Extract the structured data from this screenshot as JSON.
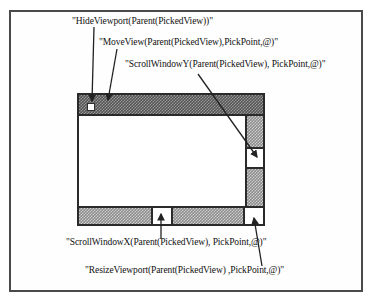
{
  "diagram": {
    "labels": {
      "hide_viewport": "\"HideViewport(Parent(PickedView))\"",
      "move_view": "\"MoveView(Parent(PickedView),PickPoint,@)\"",
      "scroll_window_y": "\"ScrollWindowY(Parent(PickedView), PickPoint,@)\"",
      "scroll_window_x": "\"ScrollWindowX(Parent(PickedView), PickPoint,@)\"",
      "resize_viewport": "\"ResizeViewport(Parent(PickedView) ,PickPoint,@)\""
    },
    "window_parts": [
      "title-bar",
      "close-box",
      "vertical-scrollbar",
      "vertical-thumb",
      "horizontal-scrollbar",
      "horizontal-thumb",
      "resize-box"
    ],
    "colors": {
      "line": "#222222",
      "frame": "#4a4a4a",
      "titlebar_pattern": "#555555",
      "scroll_pattern": "#8c8c8c"
    }
  }
}
